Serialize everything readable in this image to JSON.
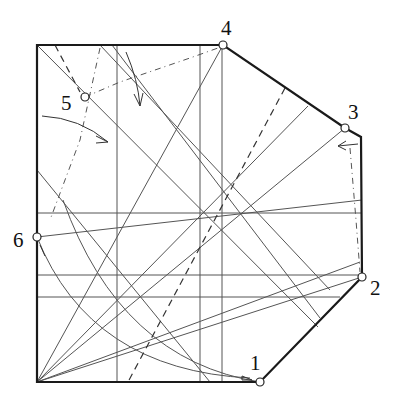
{
  "diagram": {
    "type": "origami-crease-pattern",
    "points": [
      {
        "id": "1",
        "label": "1",
        "x": 260,
        "y": 382,
        "lx": 250,
        "ly": 368
      },
      {
        "id": "2",
        "label": "2",
        "x": 362,
        "y": 277,
        "lx": 370,
        "ly": 294
      },
      {
        "id": "3",
        "label": "3",
        "x": 345,
        "y": 128,
        "lx": 347,
        "ly": 116
      },
      {
        "id": "4",
        "label": "4",
        "x": 223,
        "y": 45,
        "lx": 221,
        "ly": 33
      },
      {
        "id": "5",
        "label": "5",
        "x": 85,
        "y": 97,
        "lx": 61,
        "ly": 108
      },
      {
        "id": "6",
        "label": "6",
        "x": 37,
        "y": 237,
        "lx": 14,
        "ly": 246
      }
    ],
    "outline": "37,45 223,45 345,128 361,137 362,277 260,382 37,382",
    "colors": {
      "outline": "#1a1a1a",
      "crease": "#555555",
      "background": "#ffffff"
    }
  }
}
